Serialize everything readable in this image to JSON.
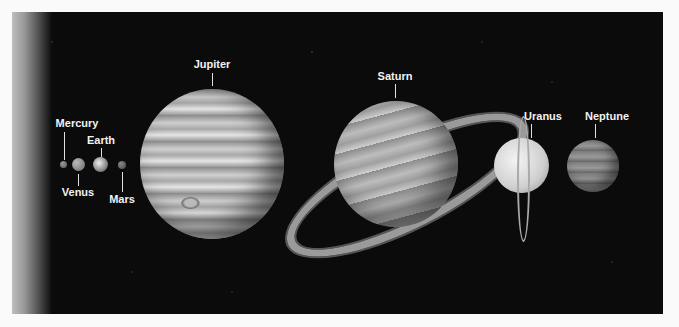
{
  "planets": [
    {
      "name": "Mercury"
    },
    {
      "name": "Venus"
    },
    {
      "name": "Earth"
    },
    {
      "name": "Mars"
    },
    {
      "name": "Jupiter"
    },
    {
      "name": "Saturn"
    },
    {
      "name": "Uranus"
    },
    {
      "name": "Neptune"
    }
  ],
  "colors": {
    "background": "#0b0b0b",
    "frame": "#fafafa",
    "label": "#f2f2f2"
  }
}
